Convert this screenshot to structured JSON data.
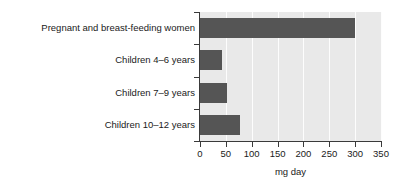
{
  "chart_data": {
    "type": "bar",
    "orientation": "horizontal",
    "title": "",
    "subtitle": "",
    "xlabel": "mg day",
    "ylabel": "",
    "categories": [
      "Pregnant and breast-feeding women",
      "Children 4–6 years",
      "Children 7–9 years",
      "Children 10–12 years"
    ],
    "values": [
      300,
      42,
      52,
      78
    ],
    "xlim": [
      0,
      350
    ],
    "xticks": [
      0,
      50,
      100,
      150,
      200,
      250,
      300,
      350
    ],
    "xtick_labels": [
      "0",
      "50",
      "100",
      "150",
      "200",
      "250",
      "300",
      "350"
    ],
    "grid": "vertical-white-gridlines",
    "legend": "none",
    "bar_color": "#555555",
    "panel_color": "#e9e9e9",
    "gridline_color": "#fdfdfd",
    "axis_color": "#3a3a3a"
  }
}
